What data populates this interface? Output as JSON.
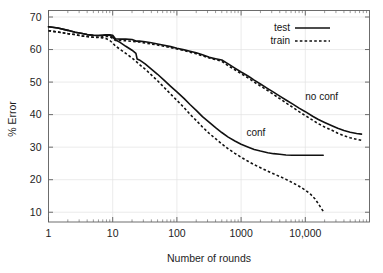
{
  "chart_data": {
    "type": "line",
    "title": "",
    "xlabel": "Number of rounds",
    "ylabel": "% Error",
    "xscale": "log",
    "xlim": [
      1,
      100000
    ],
    "ylim": [
      7,
      72
    ],
    "grid": true,
    "legend_position": "top-right",
    "xticks": [
      {
        "value": 1,
        "label": "1"
      },
      {
        "value": 10,
        "label": "10"
      },
      {
        "value": 100,
        "label": "100"
      },
      {
        "value": 1000,
        "label": "1000"
      },
      {
        "value": 10000,
        "label": "10,000"
      }
    ],
    "yticks": [
      {
        "value": 70,
        "label": "70"
      },
      {
        "value": 60,
        "label": "60"
      },
      {
        "value": 50,
        "label": "50"
      },
      {
        "value": 40,
        "label": "40"
      },
      {
        "value": 30,
        "label": "30"
      },
      {
        "value": 20,
        "label": "20"
      },
      {
        "value": 10,
        "label": "10"
      }
    ],
    "legend": [
      {
        "name": "test",
        "style": "solid"
      },
      {
        "name": "train",
        "style": "dashed"
      }
    ],
    "annotations": [
      {
        "text": "no conf",
        "x": 18000,
        "y": 44.5
      },
      {
        "text": "conf",
        "x": 1700,
        "y": 33.5
      }
    ],
    "series": [
      {
        "name": "no conf test",
        "group": "no conf",
        "style": "solid",
        "points": [
          [
            1,
            67.0
          ],
          [
            1.4,
            66.6
          ],
          [
            2,
            65.9
          ],
          [
            2.6,
            65.3
          ],
          [
            3.2,
            65.0
          ],
          [
            4,
            64.6
          ],
          [
            5,
            64.4
          ],
          [
            6,
            64.3
          ],
          [
            7,
            64.4
          ],
          [
            8,
            64.5
          ],
          [
            9,
            64.5
          ],
          [
            10,
            64.4
          ],
          [
            11,
            63.3
          ],
          [
            13,
            63.2
          ],
          [
            16,
            63.2
          ],
          [
            20,
            63.1
          ],
          [
            23,
            62.6
          ],
          [
            26,
            62.6
          ],
          [
            32,
            62.4
          ],
          [
            40,
            62.1
          ],
          [
            50,
            61.7
          ],
          [
            63,
            61.3
          ],
          [
            80,
            60.9
          ],
          [
            100,
            60.4
          ],
          [
            130,
            59.9
          ],
          [
            160,
            59.5
          ],
          [
            200,
            59.0
          ],
          [
            250,
            58.4
          ],
          [
            320,
            57.6
          ],
          [
            400,
            57.2
          ],
          [
            500,
            56.8
          ],
          [
            630,
            55.6
          ],
          [
            800,
            54.3
          ],
          [
            1000,
            53.1
          ],
          [
            1300,
            51.8
          ],
          [
            1600,
            50.6
          ],
          [
            2000,
            49.4
          ],
          [
            2600,
            48.0
          ],
          [
            3200,
            46.9
          ],
          [
            4000,
            45.7
          ],
          [
            5000,
            44.5
          ],
          [
            6300,
            43.3
          ],
          [
            8000,
            42.0
          ],
          [
            10000,
            40.9
          ],
          [
            13000,
            39.5
          ],
          [
            16000,
            38.5
          ],
          [
            20000,
            37.6
          ],
          [
            26000,
            36.6
          ],
          [
            32000,
            35.8
          ],
          [
            40000,
            35.1
          ],
          [
            50000,
            34.6
          ],
          [
            63000,
            34.2
          ],
          [
            75000,
            34.0
          ]
        ]
      },
      {
        "name": "no conf train",
        "group": "no conf",
        "style": "dashed",
        "points": [
          [
            1,
            65.8
          ],
          [
            1.4,
            65.4
          ],
          [
            2,
            64.9
          ],
          [
            2.6,
            64.6
          ],
          [
            3.2,
            64.2
          ],
          [
            4,
            64.0
          ],
          [
            5,
            63.8
          ],
          [
            6,
            63.8
          ],
          [
            7,
            63.9
          ],
          [
            8,
            64.0
          ],
          [
            9,
            64.0
          ],
          [
            10,
            63.4
          ],
          [
            11,
            62.8
          ],
          [
            13,
            62.8
          ],
          [
            16,
            62.7
          ],
          [
            20,
            62.5
          ],
          [
            23,
            62.4
          ],
          [
            26,
            62.3
          ],
          [
            32,
            62.0
          ],
          [
            40,
            61.7
          ],
          [
            50,
            61.4
          ],
          [
            63,
            61.0
          ],
          [
            80,
            60.6
          ],
          [
            100,
            60.2
          ],
          [
            130,
            59.7
          ],
          [
            160,
            59.2
          ],
          [
            200,
            58.7
          ],
          [
            250,
            58.1
          ],
          [
            320,
            57.4
          ],
          [
            400,
            56.9
          ],
          [
            500,
            56.4
          ],
          [
            630,
            55.0
          ],
          [
            800,
            53.8
          ],
          [
            1000,
            52.6
          ],
          [
            1300,
            51.2
          ],
          [
            1600,
            50.0
          ],
          [
            2000,
            48.8
          ],
          [
            2600,
            47.4
          ],
          [
            3200,
            46.2
          ],
          [
            4000,
            44.9
          ],
          [
            5000,
            43.6
          ],
          [
            6300,
            42.3
          ],
          [
            8000,
            40.9
          ],
          [
            10000,
            39.7
          ],
          [
            13000,
            38.3
          ],
          [
            16000,
            37.2
          ],
          [
            20000,
            36.2
          ],
          [
            26000,
            35.2
          ],
          [
            32000,
            34.3
          ],
          [
            40000,
            33.5
          ],
          [
            50000,
            32.9
          ],
          [
            63000,
            32.4
          ],
          [
            75000,
            32.1
          ]
        ]
      },
      {
        "name": "conf test",
        "group": "conf",
        "style": "solid",
        "points": [
          [
            1,
            67.0
          ],
          [
            1.4,
            66.6
          ],
          [
            2,
            65.9
          ],
          [
            2.6,
            65.3
          ],
          [
            3.2,
            65.0
          ],
          [
            4,
            64.6
          ],
          [
            5,
            64.4
          ],
          [
            6,
            64.3
          ],
          [
            7,
            64.4
          ],
          [
            8,
            64.5
          ],
          [
            9,
            64.4
          ],
          [
            10,
            63.8
          ],
          [
            11,
            63.0
          ],
          [
            13,
            62.2
          ],
          [
            16,
            61.0
          ],
          [
            20,
            59.8
          ],
          [
            23,
            58.8
          ],
          [
            24,
            57.1
          ],
          [
            26,
            56.8
          ],
          [
            32,
            55.6
          ],
          [
            40,
            54.0
          ],
          [
            50,
            52.4
          ],
          [
            63,
            50.6
          ],
          [
            80,
            48.7
          ],
          [
            100,
            47.0
          ],
          [
            130,
            44.9
          ],
          [
            160,
            43.1
          ],
          [
            200,
            41.3
          ],
          [
            250,
            39.4
          ],
          [
            320,
            37.6
          ],
          [
            400,
            36.0
          ],
          [
            500,
            34.5
          ],
          [
            630,
            33.1
          ],
          [
            800,
            31.9
          ],
          [
            1000,
            30.9
          ],
          [
            1300,
            30.0
          ],
          [
            1600,
            29.3
          ],
          [
            2000,
            28.8
          ],
          [
            2600,
            28.3
          ],
          [
            3200,
            28.0
          ],
          [
            4000,
            27.8
          ],
          [
            5000,
            27.6
          ],
          [
            6300,
            27.5
          ],
          [
            8000,
            27.5
          ],
          [
            10000,
            27.5
          ],
          [
            13000,
            27.5
          ],
          [
            16000,
            27.5
          ],
          [
            19000,
            27.5
          ]
        ]
      },
      {
        "name": "conf train",
        "group": "conf",
        "style": "dashed",
        "points": [
          [
            1,
            65.8
          ],
          [
            1.4,
            65.4
          ],
          [
            2,
            64.9
          ],
          [
            2.6,
            64.6
          ],
          [
            3.2,
            64.2
          ],
          [
            4,
            64.0
          ],
          [
            5,
            63.8
          ],
          [
            6,
            63.7
          ],
          [
            7,
            63.6
          ],
          [
            8,
            63.3
          ],
          [
            9,
            62.8
          ],
          [
            10,
            62.0
          ],
          [
            11,
            61.1
          ],
          [
            13,
            60.1
          ],
          [
            16,
            58.8
          ],
          [
            20,
            57.4
          ],
          [
            23,
            56.4
          ],
          [
            26,
            55.4
          ],
          [
            32,
            54.0
          ],
          [
            40,
            52.2
          ],
          [
            50,
            50.4
          ],
          [
            63,
            48.4
          ],
          [
            80,
            46.3
          ],
          [
            100,
            44.4
          ],
          [
            130,
            42.1
          ],
          [
            160,
            40.1
          ],
          [
            200,
            38.2
          ],
          [
            250,
            36.2
          ],
          [
            320,
            34.2
          ],
          [
            400,
            32.6
          ],
          [
            500,
            31.0
          ],
          [
            630,
            29.5
          ],
          [
            800,
            28.1
          ],
          [
            1000,
            26.9
          ],
          [
            1300,
            25.6
          ],
          [
            1600,
            24.6
          ],
          [
            2000,
            23.7
          ],
          [
            2600,
            22.6
          ],
          [
            3200,
            21.8
          ],
          [
            4000,
            21.0
          ],
          [
            5000,
            20.1
          ],
          [
            6300,
            19.1
          ],
          [
            8000,
            18.0
          ],
          [
            10000,
            16.8
          ],
          [
            12000,
            15.6
          ],
          [
            14000,
            14.2
          ],
          [
            16000,
            12.6
          ],
          [
            18000,
            11.0
          ],
          [
            19500,
            10.0
          ]
        ]
      }
    ]
  }
}
